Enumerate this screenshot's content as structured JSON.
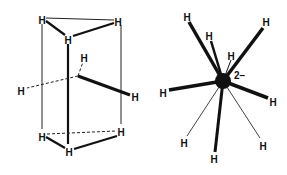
{
  "figure": {
    "left": {
      "title": "Trigonal prism of hydrogen atoms with central metal",
      "atoms": [
        {
          "id": "top_left",
          "label": "H",
          "x": 42,
          "y": 21
        },
        {
          "id": "top_right",
          "label": "H",
          "x": 118,
          "y": 23
        },
        {
          "id": "top_front",
          "label": "H",
          "x": 68,
          "y": 41
        },
        {
          "id": "mid_up",
          "label": "H",
          "x": 84,
          "y": 59
        },
        {
          "id": "mid_left",
          "label": "H",
          "x": 21,
          "y": 92
        },
        {
          "id": "mid_right",
          "label": "H",
          "x": 135,
          "y": 98
        },
        {
          "id": "bot_left",
          "label": "H",
          "x": 42,
          "y": 138
        },
        {
          "id": "bot_right",
          "label": "H",
          "x": 121,
          "y": 133
        },
        {
          "id": "bot_front",
          "label": "H",
          "x": 69,
          "y": 153
        }
      ]
    },
    "right": {
      "title": "Nine-coordinate metal hydride anion",
      "charge": "2−",
      "center": {
        "x": 223,
        "y": 81,
        "r": 8
      },
      "atoms": [
        {
          "label": "H",
          "x": 187,
          "y": 18
        },
        {
          "label": "H",
          "x": 266,
          "y": 23
        },
        {
          "label": "H",
          "x": 209,
          "y": 37
        },
        {
          "label": "H",
          "x": 231,
          "y": 57
        },
        {
          "label": "H",
          "x": 163,
          "y": 94
        },
        {
          "label": "H",
          "x": 273,
          "y": 103
        },
        {
          "label": "H",
          "x": 184,
          "y": 144
        },
        {
          "label": "H",
          "x": 263,
          "y": 147
        },
        {
          "label": "H",
          "x": 214,
          "y": 160
        }
      ]
    }
  }
}
